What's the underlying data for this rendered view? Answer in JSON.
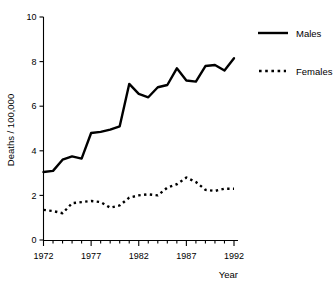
{
  "chart_data": {
    "type": "line",
    "title": "",
    "xlabel": "Year",
    "ylabel": "Deaths / 100,000",
    "xlim": [
      1972,
      1992
    ],
    "ylim": [
      0,
      10
    ],
    "yticks": [
      0,
      2,
      4,
      6,
      8,
      10
    ],
    "ytick_labels": [
      "0",
      "2",
      "4",
      "6",
      "8",
      "10"
    ],
    "xticks": [
      1972,
      1973,
      1974,
      1975,
      1976,
      1977,
      1978,
      1979,
      1980,
      1981,
      1982,
      1983,
      1984,
      1985,
      1986,
      1987,
      1988,
      1989,
      1990,
      1991,
      1992
    ],
    "xtick_labels_shown": [
      "1972",
      "1977",
      "1982",
      "1987",
      "1992"
    ],
    "xtick_labels_shown_at": [
      1972,
      1977,
      1982,
      1987,
      1992
    ],
    "grid": false,
    "legend_position": "right",
    "x": [
      1972,
      1973,
      1974,
      1975,
      1976,
      1977,
      1978,
      1979,
      1980,
      1981,
      1982,
      1983,
      1984,
      1985,
      1986,
      1987,
      1988,
      1989,
      1990,
      1991,
      1992
    ],
    "series": [
      {
        "name": "Males",
        "style": "solid",
        "color": "#000000",
        "values": [
          3.05,
          3.1,
          3.6,
          3.75,
          3.65,
          4.8,
          4.85,
          4.95,
          5.1,
          7.0,
          6.55,
          6.4,
          6.85,
          6.95,
          7.7,
          7.15,
          7.1,
          7.8,
          7.85,
          7.6,
          8.15
        ]
      },
      {
        "name": "Females",
        "style": "dotted",
        "color": "#000000",
        "values": [
          1.35,
          1.3,
          1.2,
          1.65,
          1.7,
          1.75,
          1.7,
          1.45,
          1.55,
          1.9,
          2.0,
          2.05,
          2.0,
          2.35,
          2.5,
          2.8,
          2.6,
          2.25,
          2.2,
          2.3,
          2.3
        ]
      }
    ]
  },
  "legend": {
    "entries": [
      {
        "label": "Males",
        "style": "solid"
      },
      {
        "label": "Females",
        "style": "dotted"
      }
    ]
  },
  "axes": {
    "y_title": "Deaths / 100,000",
    "x_title": "Year"
  }
}
